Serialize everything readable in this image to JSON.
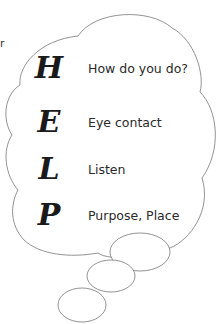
{
  "acronym": {
    "rows": [
      {
        "letter": "H",
        "text": "How do you do?"
      },
      {
        "letter": "E",
        "text": "Eye contact"
      },
      {
        "letter": "L",
        "text": "Listen"
      },
      {
        "letter": "P",
        "text": "Purpose, Place"
      }
    ]
  },
  "stray_text": "r",
  "colors": {
    "outline": "#777777",
    "text": "#2a2a2a"
  }
}
